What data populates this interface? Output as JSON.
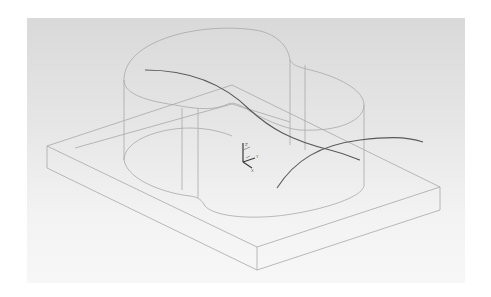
{
  "viewport": {
    "background_top": "#d9d9d9",
    "background_bottom": "#f7f7f7",
    "edge_color": "#a8a8a8",
    "curve_color": "#5a5a5a"
  },
  "scene": {
    "objects": [
      {
        "name": "base-slab",
        "type": "rectangular box (wireframe)"
      },
      {
        "name": "extruded-profile",
        "type": "two-lobed cylinder extrusion (wireframe)"
      },
      {
        "name": "spline-curve-1",
        "type": "freeform curve"
      },
      {
        "name": "spline-curve-2",
        "type": "freeform curve"
      }
    ],
    "triad": {
      "labels": [
        "Z",
        "Y",
        "X"
      ]
    }
  }
}
